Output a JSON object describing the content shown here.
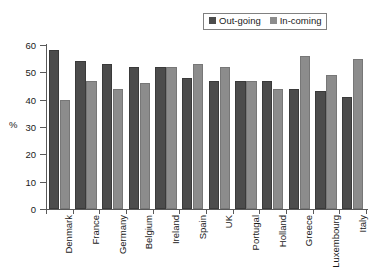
{
  "chart_data": {
    "type": "bar",
    "title": "",
    "xlabel": "",
    "ylabel": "%",
    "ylim": [
      0,
      60
    ],
    "yticks": [
      0,
      10,
      20,
      30,
      40,
      50,
      60
    ],
    "grid": false,
    "legend_position": "top-right",
    "categories": [
      "Denmark",
      "France",
      "Germany",
      "Belgium",
      "Ireland",
      "Spain",
      "UK",
      "Portugal",
      "Holland",
      "Greece",
      "Luxembourg",
      "Italy"
    ],
    "series": [
      {
        "name": "Out-going",
        "color": "#4c4c4c",
        "values": [
          58,
          54,
          53,
          52,
          52,
          48,
          47,
          47,
          47,
          44,
          43,
          41
        ]
      },
      {
        "name": "In-coming",
        "color": "#8c8c8c",
        "values": [
          40,
          47,
          44,
          46,
          52,
          53,
          52,
          47,
          44,
          56,
          49,
          55
        ]
      }
    ]
  },
  "legend": {
    "entries": [
      {
        "label": "Out-going",
        "swatch": "outgoing"
      },
      {
        "label": "In-coming",
        "swatch": "incoming"
      }
    ]
  },
  "axes": {
    "y_title": "%",
    "y_tick_labels": [
      "60",
      "50",
      "40",
      "30",
      "20",
      "10",
      "0"
    ]
  }
}
